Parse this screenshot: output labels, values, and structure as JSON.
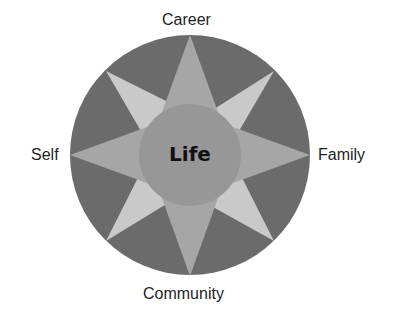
{
  "diagram": {
    "center_label": "Life",
    "labels": {
      "top": "Career",
      "left": "Self",
      "right": "Family",
      "bottom": "Community"
    },
    "colors": {
      "outer_circle": "#6b6b6b",
      "diagonal_points": "#c9c9c9",
      "main_star": "#a6a6a6",
      "inner_circle": "#979797",
      "text": "#1e1e1e"
    }
  }
}
